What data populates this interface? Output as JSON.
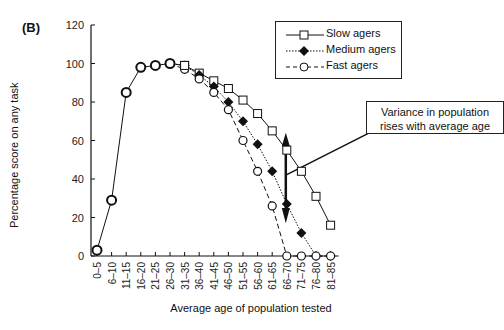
{
  "panel_label": "(B)",
  "chart_data": {
    "type": "line",
    "title": "",
    "xlabel": "Average age of population tested",
    "ylabel": "Percentage score on any task",
    "ylim": [
      0,
      120
    ],
    "yticks": [
      0,
      20,
      40,
      60,
      80,
      100,
      120
    ],
    "grid": false,
    "legend_position": "upper right",
    "categories": [
      "0–5",
      "6–10",
      "11–15",
      "16–20",
      "21–25",
      "26–30",
      "31–35",
      "36–40",
      "41–45",
      "46–50",
      "51–55",
      "56–60",
      "61–65",
      "66–70",
      "71–75",
      "76–80",
      "81–85"
    ],
    "series": [
      {
        "name": "Slow agers",
        "marker": "open-square",
        "line": "solid",
        "values": [
          3,
          29,
          85,
          98,
          99,
          100,
          99,
          95,
          91,
          87,
          81,
          74,
          65,
          55,
          44,
          31,
          16
        ]
      },
      {
        "name": "Medium agers",
        "marker": "filled-diamond",
        "line": "dotted",
        "values": [
          3,
          29,
          85,
          98,
          99,
          100,
          99,
          94,
          88,
          80,
          70,
          58,
          44,
          27,
          12,
          0,
          0
        ]
      },
      {
        "name": "Fast agers",
        "marker": "open-circle",
        "line": "dashed",
        "values": [
          3,
          29,
          85,
          98,
          99,
          100,
          97,
          92,
          85,
          76,
          60,
          44,
          26,
          0,
          0,
          0,
          0
        ]
      }
    ],
    "annotations": [
      {
        "text": "Variance in population rises with average age",
        "points_to_category": "66–70"
      }
    ]
  },
  "legend": {
    "items": [
      {
        "label": "Slow agers"
      },
      {
        "label": "Medium agers"
      },
      {
        "label": "Fast agers"
      }
    ]
  },
  "annotation": {
    "line1": "Variance in population",
    "line2": "rises with average age"
  }
}
